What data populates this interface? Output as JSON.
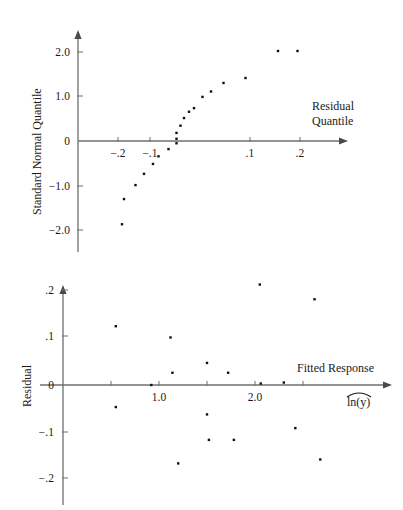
{
  "figure": {
    "background_color": "#ffffff",
    "point_color": "#111111",
    "axis_color": "#6f6f6f"
  },
  "chart_data": [
    {
      "type": "scatter",
      "id": "normal-quantile-plot",
      "title": "",
      "xlabel": "Residual Quantile",
      "ylabel": "Standard Normal Quantile",
      "xticks": [
        -0.2,
        -0.1,
        0.1,
        0.2
      ],
      "xticklabels": [
        "−.2",
        "−.1",
        ".1",
        ".2"
      ],
      "yticks": [
        2.0,
        1.0,
        0,
        -1.0,
        -2.0
      ],
      "yticklabels": [
        "2.0",
        "1.0",
        "0",
        "−1.0",
        "−2.0"
      ],
      "xlim": [
        -0.26,
        0.255
      ],
      "ylim": [
        -2.35,
        2.4
      ],
      "grid": false,
      "legend": false,
      "x": [
        -0.156,
        -0.152,
        -0.129,
        -0.112,
        -0.094,
        -0.083,
        -0.063,
        -0.047,
        -0.047,
        -0.047,
        -0.039,
        -0.032,
        -0.022,
        -0.012,
        0.005,
        0.022,
        0.047,
        0.091,
        0.156,
        0.195
      ],
      "y": [
        -1.85,
        -1.29,
        -0.98,
        -0.73,
        -0.51,
        -0.34,
        -0.18,
        -0.05,
        0.05,
        0.18,
        0.34,
        0.51,
        0.65,
        0.73,
        0.98,
        1.1,
        1.29,
        1.4,
        2.0,
        2.0
      ]
    },
    {
      "type": "scatter",
      "id": "residual-vs-fitted-plot",
      "title": "",
      "xlabel": "Fitted Response",
      "xlabel_secondary": "ln(y)",
      "xlabel_secondary_accent": "hat",
      "ylabel": "Residual",
      "xticks": [
        0.5,
        1.0,
        1.5,
        2.0,
        2.5
      ],
      "xticklabels": [
        "",
        "1.0",
        "",
        "2.0",
        ""
      ],
      "yticks": [
        0.2,
        0.1,
        0,
        -0.1,
        -0.2
      ],
      "yticklabels": [
        ".2",
        ".1",
        "0",
        "−.1",
        "−.2"
      ],
      "xlim": [
        0.0,
        3.1
      ],
      "ylim": [
        -0.23,
        0.235
      ],
      "grid": false,
      "legend": false,
      "x": [
        0.55,
        0.55,
        0.92,
        1.12,
        1.14,
        1.2,
        1.5,
        1.5,
        1.52,
        1.72,
        1.78,
        2.05,
        2.06,
        2.3,
        2.42,
        2.62,
        2.68
      ],
      "y": [
        0.12,
        -0.045,
        0.0,
        0.097,
        0.025,
        -0.16,
        0.045,
        -0.06,
        -0.112,
        0.025,
        -0.112,
        0.205,
        0.003,
        0.005,
        -0.088,
        0.175,
        -0.152
      ]
    }
  ],
  "labels": {
    "top_y_axis_title": "Standard Normal Quantile",
    "top_x_axis_title_line1": "Residual",
    "top_x_axis_title_line2": "Quantile",
    "bottom_y_axis_title": "Residual",
    "bottom_x_axis_title": "Fitted Response",
    "bottom_x_axis_symbol": "ln(y)"
  },
  "top_ticks": {
    "x": [
      {
        "label": "−.2",
        "px": 118
      },
      {
        "label": "−.1",
        "px": 150
      },
      {
        "label": ".1",
        "px": 250
      },
      {
        "label": ".2",
        "px": 300
      }
    ],
    "y": [
      {
        "label": "2.0",
        "px": 52
      },
      {
        "label": "1.0",
        "px": 96
      },
      {
        "label": "0",
        "px": 141
      },
      {
        "label": "−1.0",
        "px": 186
      },
      {
        "label": "−2.0",
        "px": 230
      }
    ]
  },
  "bottom_ticks": {
    "x": [
      {
        "label": "",
        "px": 111
      },
      {
        "label": "1.0",
        "px": 159
      },
      {
        "label": "",
        "px": 207
      },
      {
        "label": "2.0",
        "px": 255
      },
      {
        "label": "",
        "px": 303
      }
    ],
    "y": [
      {
        "label": ".2",
        "px": 290
      },
      {
        "label": ".1",
        "px": 336
      },
      {
        "label": "0",
        "px": 385
      },
      {
        "label": "−.1",
        "px": 432
      },
      {
        "label": "−.2",
        "px": 478
      }
    ]
  }
}
